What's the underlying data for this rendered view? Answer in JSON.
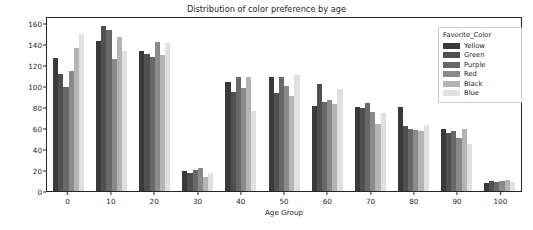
{
  "chart_data": {
    "type": "bar",
    "title": "Distribution of color preference by age",
    "xlabel": "Age Group",
    "ylabel": "count",
    "grid": false,
    "legend_position": "upper right",
    "legend_title": "Favorite_Color",
    "categories": [
      "0",
      "10",
      "20",
      "30",
      "40",
      "50",
      "60",
      "70",
      "80",
      "90",
      "100"
    ],
    "ylim": [
      0,
      167
    ],
    "yticks": [
      0,
      20,
      40,
      60,
      80,
      100,
      120,
      140,
      160
    ],
    "series": [
      {
        "name": "Yellow",
        "color": "#3a3a3a",
        "values": [
          128,
          145,
          135,
          19,
          105,
          110,
          82,
          81,
          81,
          60,
          8
        ]
      },
      {
        "name": "Green",
        "color": "#4f4f4f",
        "values": [
          113,
          159,
          132,
          17,
          96,
          95,
          103,
          80,
          63,
          56,
          10
        ]
      },
      {
        "name": "Purple",
        "color": "#686868",
        "values": [
          100,
          155,
          129,
          20,
          110,
          110,
          86,
          85,
          60,
          58,
          9
        ]
      },
      {
        "name": "Red",
        "color": "#8a8a8a",
        "values": [
          116,
          127,
          144,
          22,
          99,
          101,
          88,
          76,
          59,
          51,
          10
        ]
      },
      {
        "name": "Black",
        "color": "#b4b4b4",
        "values": [
          138,
          149,
          131,
          14,
          110,
          92,
          84,
          65,
          58,
          60,
          11
        ]
      },
      {
        "name": "Blue",
        "color": "#e0e0e0",
        "values": [
          152,
          135,
          143,
          17,
          77,
          112,
          98,
          75,
          64,
          45,
          9
        ]
      }
    ]
  }
}
